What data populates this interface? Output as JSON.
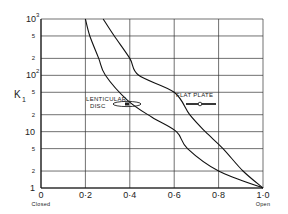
{
  "chart_data": {
    "type": "line",
    "title": "",
    "xlabel": "",
    "ylabel": "K1",
    "ylabel_main": "K",
    "ylabel_sub": "1",
    "xscale": "linear",
    "yscale": "log",
    "xlim": [
      0,
      1.0
    ],
    "ylim": [
      1,
      1000
    ],
    "grid": true,
    "x_ticks": [
      "0",
      "0·2",
      "0·4",
      "0·6",
      "0·8",
      "1·0"
    ],
    "x_tick_values": [
      0,
      0.2,
      0.4,
      0.6,
      0.8,
      1.0
    ],
    "x_tick_sublabels": {
      "0": "Closed",
      "1·0": "Open"
    },
    "y_ticks": [
      {
        "value": 1000,
        "label": "10",
        "sup": "3"
      },
      {
        "value": 500,
        "label": "5",
        "sup": ""
      },
      {
        "value": 200,
        "label": "2",
        "sup": ""
      },
      {
        "value": 100,
        "label": "10",
        "sup": "2"
      },
      {
        "value": 50,
        "label": "5",
        "sup": ""
      },
      {
        "value": 20,
        "label": "2",
        "sup": ""
      },
      {
        "value": 10,
        "label": "10",
        "sup": ""
      },
      {
        "value": 5,
        "label": "5",
        "sup": ""
      },
      {
        "value": 2,
        "label": "2",
        "sup": ""
      },
      {
        "value": 1,
        "label": "1",
        "sup": ""
      }
    ],
    "series": [
      {
        "name": "LENTICULAR DISC",
        "label_lines": [
          "LENTICULAR",
          "DISC"
        ],
        "x": [
          0.2,
          0.22,
          0.26,
          0.29,
          0.39,
          0.5,
          0.61,
          0.66,
          0.8,
          1.0
        ],
        "y": [
          1000,
          500,
          200,
          100,
          36,
          18,
          10,
          5,
          2,
          1
        ]
      },
      {
        "name": "FLAT PLATE",
        "label_lines": [
          "FLAT PLATE"
        ],
        "x": [
          0.28,
          0.33,
          0.4,
          0.44,
          0.6,
          0.67,
          0.74,
          0.82,
          0.91,
          1.0
        ],
        "y": [
          1000,
          500,
          200,
          100,
          50,
          20,
          10,
          5,
          2,
          1
        ]
      }
    ],
    "legend_position": "inline annotations"
  }
}
